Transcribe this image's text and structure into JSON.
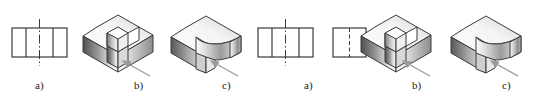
{
  "figure": {
    "background": "#ffffff",
    "line_color": "#3a3a3a",
    "label_color": "#222222",
    "groups": [
      {
        "id": "left-group",
        "captions": [
          {
            "key": "a",
            "label": "a)",
            "x": 41,
            "y": 84
          },
          {
            "key": "b",
            "label": "b)",
            "x": 140,
            "y": 84
          },
          {
            "key": "c",
            "label": "c)",
            "x": 228,
            "y": 84
          }
        ],
        "views": [
          {
            "id": "left-ortho-front",
            "type": "orthographic-rectangle-divided",
            "caption": "a)",
            "rect": {
              "x": 12,
              "y": 28,
              "w": 55,
              "h": 29
            },
            "internal_verticals": [
              26,
              53
            ],
            "centerline": {
              "type": "dash-dot",
              "x": 39.5,
              "y1": 19,
              "y2": 66
            }
          },
          {
            "id": "left-iso-b",
            "type": "isometric-square-notch-block",
            "caption": "b)",
            "arrow": {
              "from_x": 150,
              "from_y": 76,
              "to_x": 122,
              "to_y": 60
            }
          },
          {
            "id": "left-iso-c",
            "type": "isometric-round-notch-block",
            "caption": "c)",
            "arrow": {
              "from_x": 238,
              "from_y": 76,
              "to_x": 210,
              "to_y": 60
            }
          }
        ]
      },
      {
        "id": "right-group",
        "captions": [
          {
            "key": "a",
            "label": "a)",
            "x": 310,
            "y": 84
          },
          {
            "key": "b",
            "label": "b)",
            "x": 418,
            "y": 84
          },
          {
            "key": "c",
            "label": "c)",
            "x": 508,
            "y": 84
          }
        ],
        "views": [
          {
            "id": "right-ortho-front",
            "type": "orthographic-rectangle-divided",
            "caption": "a)",
            "rect": {
              "x": 258,
              "y": 28,
              "w": 55,
              "h": 29
            },
            "internal_verticals": [
              272,
              299
            ],
            "centerline": {
              "type": "dash-dot",
              "x": 285.5,
              "y1": 19,
              "y2": 66
            }
          },
          {
            "id": "right-ortho-side",
            "type": "orthographic-square-hidden-line",
            "caption": "a)",
            "rect": {
              "x": 333,
              "y": 28,
              "w": 33,
              "h": 29
            },
            "hidden_line": {
              "type": "dashed",
              "x": 349.5,
              "y1": 28,
              "y2": 57
            }
          },
          {
            "id": "right-iso-b",
            "type": "isometric-square-notch-block",
            "caption": "b)",
            "arrow": {
              "from_x": 430,
              "from_y": 76,
              "to_x": 402,
              "to_y": 60
            }
          },
          {
            "id": "right-iso-c",
            "type": "isometric-round-notch-block",
            "caption": "c)",
            "arrow": {
              "from_x": 518,
              "from_y": 76,
              "to_x": 490,
              "to_y": 60
            }
          }
        ]
      }
    ],
    "shading": {
      "front_face_dark": "#4a4a4a",
      "front_face_light": "#f2f2f2",
      "side_face_dark": "#6e6e6e",
      "side_face_light": "#ffffff",
      "top_face_dark": "#bdbdbd",
      "top_face_light": "#ffffff",
      "inner_face_dark": "#8a8a8a",
      "inner_face_light": "#fbfbfb",
      "arrow_color": "#9a9a9a"
    }
  }
}
